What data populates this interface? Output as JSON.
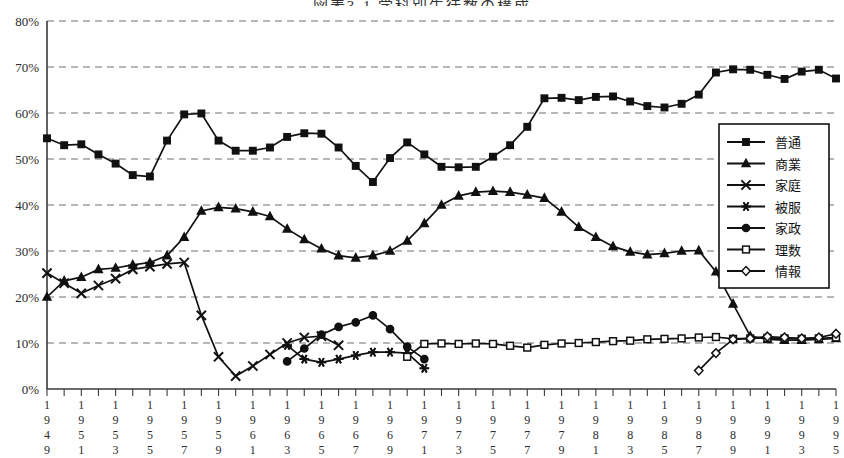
{
  "chart": {
    "title": "図表3-1 学科別生徒数の構成",
    "type": "line",
    "ylabel": "",
    "xlabel": "",
    "ylim": [
      0,
      80
    ],
    "yticks": [
      "0%",
      "10%",
      "20%",
      "30%",
      "40%",
      "50%",
      "60%",
      "70%",
      "80%"
    ],
    "grid": true,
    "legend_position": "right-inside",
    "x_start": 1949,
    "x_end": 1995,
    "xticks": [
      "1949",
      "1951",
      "1953",
      "1955",
      "1957",
      "1959",
      "1961",
      "1963",
      "1965",
      "1967",
      "1969",
      "1971",
      "1973",
      "1975",
      "1977",
      "1979",
      "1981",
      "1983",
      "1985",
      "1987",
      "1989",
      "1991",
      "1993",
      "1995"
    ]
  },
  "chart_data": {
    "type": "line",
    "title": "図表3-1 学科別生徒数の構成",
    "xlabel": "",
    "ylabel": "",
    "ylim": [
      0,
      80
    ],
    "grid": true,
    "legend": [
      "普通",
      "商業",
      "家庭",
      "被服",
      "家政",
      "理数",
      "情報"
    ],
    "x": [
      1949,
      1950,
      1951,
      1952,
      1953,
      1954,
      1955,
      1956,
      1957,
      1958,
      1959,
      1960,
      1961,
      1962,
      1963,
      1964,
      1965,
      1966,
      1967,
      1968,
      1969,
      1970,
      1971,
      1972,
      1973,
      1974,
      1975,
      1976,
      1977,
      1978,
      1979,
      1980,
      1981,
      1982,
      1983,
      1984,
      1985,
      1986,
      1987,
      1988,
      1989,
      1990,
      1991,
      1992,
      1993,
      1994,
      1995
    ],
    "series": [
      {
        "name": "普通",
        "marker": "filled-square",
        "values": [
          54.5,
          53.0,
          53.2,
          51.0,
          49.0,
          46.5,
          46.2,
          54.0,
          59.7,
          59.9,
          54.0,
          51.8,
          51.8,
          52.5,
          54.8,
          55.6,
          55.5,
          52.5,
          48.5,
          45.0,
          50.2,
          53.6,
          51.0,
          48.3,
          48.2,
          48.3,
          50.5,
          53.0,
          57.0,
          63.2,
          63.3,
          62.8,
          63.5,
          63.6,
          62.5,
          61.5,
          61.2,
          62.0,
          64.0,
          68.8,
          69.5,
          69.4,
          68.3,
          67.4,
          69.0,
          69.4,
          67.5
        ]
      },
      {
        "name": "商業",
        "marker": "filled-triangle",
        "values": [
          20.0,
          23.5,
          24.3,
          26.0,
          26.3,
          27.0,
          27.5,
          29.0,
          33.0,
          38.7,
          39.5,
          39.2,
          38.5,
          37.5,
          34.8,
          32.5,
          30.5,
          29.0,
          28.5,
          29.0,
          30.0,
          32.2,
          36.0,
          40.0,
          42.0,
          42.8,
          43.0,
          42.8,
          42.2,
          41.5,
          38.5,
          35.2,
          33.0,
          31.0,
          29.8,
          29.2,
          29.5,
          30.0,
          30.1,
          25.5,
          18.5,
          11.5,
          10.8,
          10.6,
          10.6,
          10.8,
          11.0
        ]
      },
      {
        "name": "家庭",
        "marker": "x-cross",
        "values": [
          25.2,
          23.0,
          20.8,
          22.5,
          24.0,
          26.0,
          26.6,
          27.2,
          27.5,
          16.0,
          7.0,
          2.8,
          5.0,
          7.5,
          10.0,
          11.2,
          11.5,
          9.5,
          null,
          null,
          null,
          null,
          null,
          null,
          null,
          null,
          null,
          null,
          null,
          null,
          null,
          null,
          null,
          null,
          null,
          null,
          null,
          null,
          null,
          null,
          null,
          null,
          null,
          null,
          null,
          null,
          null
        ]
      },
      {
        "name": "被服",
        "marker": "asterisk",
        "values": [
          null,
          null,
          null,
          null,
          null,
          null,
          null,
          null,
          null,
          null,
          null,
          null,
          null,
          null,
          9.5,
          6.5,
          5.8,
          6.5,
          7.3,
          8.0,
          8.0,
          7.8,
          4.5,
          null,
          null,
          null,
          null,
          null,
          null,
          null,
          null,
          null,
          null,
          null,
          null,
          null,
          null,
          null,
          null,
          null,
          null,
          null,
          null,
          null,
          null,
          null,
          null
        ]
      },
      {
        "name": "家政",
        "marker": "filled-circle",
        "values": [
          null,
          null,
          null,
          null,
          null,
          null,
          null,
          null,
          null,
          null,
          null,
          null,
          null,
          null,
          6.0,
          8.8,
          11.8,
          13.5,
          14.5,
          16.0,
          13.0,
          9.2,
          6.5,
          null,
          null,
          null,
          null,
          null,
          null,
          null,
          null,
          null,
          null,
          null,
          null,
          null,
          null,
          null,
          null,
          null,
          null,
          null,
          null,
          null,
          null,
          null,
          null
        ]
      },
      {
        "name": "理数",
        "marker": "open-square",
        "values": [
          null,
          null,
          null,
          null,
          null,
          null,
          null,
          null,
          null,
          null,
          null,
          null,
          null,
          null,
          null,
          null,
          null,
          null,
          null,
          null,
          null,
          7.0,
          9.8,
          9.9,
          9.8,
          9.9,
          9.8,
          9.4,
          9.0,
          9.6,
          9.9,
          10.0,
          10.2,
          10.4,
          10.5,
          10.8,
          10.9,
          11.0,
          11.2,
          11.3,
          10.9,
          11.0,
          11.1,
          11.0,
          10.9,
          11.0,
          11.2
        ]
      },
      {
        "name": "情報",
        "marker": "open-diamond",
        "values": [
          null,
          null,
          null,
          null,
          null,
          null,
          null,
          null,
          null,
          null,
          null,
          null,
          null,
          null,
          null,
          null,
          null,
          null,
          null,
          null,
          null,
          null,
          null,
          null,
          null,
          null,
          null,
          null,
          null,
          null,
          null,
          null,
          null,
          null,
          null,
          null,
          null,
          null,
          4.0,
          7.8,
          10.8,
          11.0,
          11.4,
          11.2,
          11.0,
          11.2,
          12.0
        ]
      }
    ]
  },
  "legend": {
    "items": [
      {
        "label": "普通",
        "marker": "filled-square"
      },
      {
        "label": "商業",
        "marker": "filled-triangle"
      },
      {
        "label": "家庭",
        "marker": "x-cross"
      },
      {
        "label": "被服",
        "marker": "asterisk"
      },
      {
        "label": "家政",
        "marker": "filled-circle"
      },
      {
        "label": "理数",
        "marker": "open-square"
      },
      {
        "label": "情報",
        "marker": "open-diamond"
      }
    ]
  }
}
